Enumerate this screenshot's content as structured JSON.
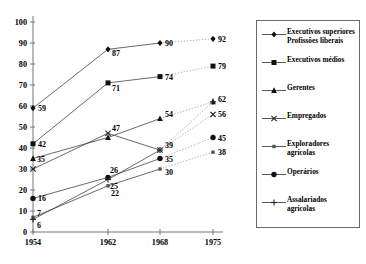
{
  "chart_data": {
    "type": "line",
    "title": "",
    "xlabel": "",
    "ylabel": "",
    "categories": [
      "1954",
      "1962",
      "1968",
      "1975"
    ],
    "x": [
      1954,
      1962,
      1968,
      1975
    ],
    "ylim": [
      0,
      100
    ],
    "yticks": [
      0,
      10,
      20,
      30,
      40,
      50,
      60,
      70,
      80,
      90,
      100
    ],
    "grid": false,
    "legend_position": "right",
    "series": [
      {
        "name": "Executivos superiores\nProfissões liberais",
        "marker": "diamond",
        "values": [
          59,
          87,
          90,
          92
        ],
        "labels": [
          "59",
          "87",
          "90",
          "92"
        ]
      },
      {
        "name": "Executivos médios",
        "marker": "square",
        "values": [
          42,
          71,
          74,
          79
        ],
        "labels": [
          "42",
          "71",
          "74",
          "79"
        ]
      },
      {
        "name": "Gerentes",
        "marker": "triangle",
        "values": [
          35,
          45,
          54,
          62
        ],
        "labels": [
          "35",
          "",
          "54",
          ""
        ]
      },
      {
        "name": "Empregados",
        "marker": "cross",
        "values": [
          30,
          47,
          39,
          56
        ],
        "labels": [
          "",
          "47",
          "",
          "56"
        ]
      },
      {
        "name": "Exploradores agrícolas",
        "marker": "small-square",
        "values": [
          7,
          22,
          30,
          38
        ],
        "labels": [
          "7",
          "22",
          "30",
          "38"
        ]
      },
      {
        "name": "Operários",
        "marker": "circle",
        "values": [
          16,
          26,
          35,
          45
        ],
        "labels": [
          "16",
          "26",
          "35",
          "45"
        ]
      },
      {
        "name": "Assalariados agrícolas",
        "marker": "plus",
        "values": [
          6,
          25,
          39,
          62
        ],
        "labels": [
          "6",
          "25",
          "39",
          "62"
        ]
      }
    ]
  },
  "axis": {
    "y_labels": [
      "100",
      "90",
      "80",
      "70",
      "60",
      "50",
      "40",
      "30",
      "20",
      "10",
      "0"
    ],
    "x_labels": [
      "1954",
      "1962",
      "1968",
      "1975"
    ]
  },
  "legend": {
    "items": [
      {
        "label": "Executivos superiores\nProfissões liberais",
        "marker": "diamond"
      },
      {
        "label": "Executivos médios",
        "marker": "square"
      },
      {
        "label": "Gerentes",
        "marker": "triangle"
      },
      {
        "label": "Empregados",
        "marker": "cross"
      },
      {
        "label": "Exploradores agrícolas",
        "marker": "small-square"
      },
      {
        "label": "Operários",
        "marker": "circle"
      },
      {
        "label": "Assalariados agrícolas",
        "marker": "plus"
      }
    ]
  },
  "colors": {
    "axis": "#777777",
    "line": "#444444",
    "dotted": "#aaaaaa",
    "text": "#000000",
    "legend_border": "#6b6b6b"
  }
}
